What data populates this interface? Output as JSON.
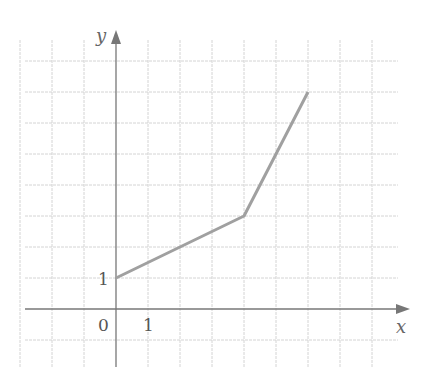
{
  "chart_data": {
    "type": "line",
    "title": "",
    "xlabel": "x",
    "ylabel": "y",
    "x": [
      0,
      4,
      6
    ],
    "series": [
      {
        "name": "piecewise linear",
        "x": [
          0,
          4,
          6
        ],
        "values": [
          1,
          3,
          7
        ]
      }
    ],
    "tick_labels": {
      "origin": "0",
      "x": [
        "1"
      ],
      "y": [
        "1"
      ]
    },
    "xlim": [
      -3,
      8
    ],
    "ylim": [
      -1,
      8
    ],
    "grid": true,
    "legend": null
  },
  "labels": {
    "x_axis": "x",
    "y_axis": "y",
    "origin": "0",
    "x_tick": "1",
    "y_tick": "1"
  },
  "colors": {
    "curve": "#a0a0a0",
    "axis": "#777777",
    "grid": "#d4d4d4"
  }
}
